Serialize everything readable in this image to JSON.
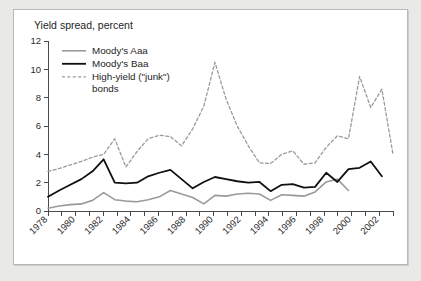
{
  "figure": {
    "title": "Yield spread, percent",
    "panel_bg": "#ffffff",
    "outer_bg": "#e9e9e7",
    "frame_color": "#b9b9b7"
  },
  "legend": {
    "position": "top-left-inside",
    "items": [
      {
        "label": "Moody's Aaa",
        "color": "#9a9a9a",
        "dash": "none",
        "width": 1.6
      },
      {
        "label": "Moody's Baa",
        "color": "#101010",
        "dash": "none",
        "width": 1.8
      },
      {
        "label": "High-yield (\"junk\")",
        "label2": "bonds",
        "color": "#9a9a9a",
        "dash": "3,2.4",
        "width": 1.3
      }
    ]
  },
  "chart_data": {
    "type": "line",
    "title": "Yield spread, percent",
    "xlabel": "",
    "ylabel": "Yield spread, percent",
    "ylim": [
      0,
      12
    ],
    "yticks": [
      0,
      2,
      4,
      6,
      8,
      10,
      12
    ],
    "xlim": [
      1978,
      2003
    ],
    "xticks": [
      1978,
      1980,
      1982,
      1984,
      1986,
      1988,
      1990,
      1992,
      1994,
      1996,
      1998,
      2000,
      2002
    ],
    "xticks_minor": [
      1978,
      1979,
      1980,
      1981,
      1982,
      1983,
      1984,
      1985,
      1986,
      1987,
      1988,
      1989,
      1990,
      1991,
      1992,
      1993,
      1994,
      1995,
      1996,
      1997,
      1998,
      1999,
      2000,
      2001,
      2002,
      2003
    ],
    "grid": false,
    "x": [
      1978,
      1979,
      1980,
      1981,
      1982,
      1983,
      1984,
      1985,
      1986,
      1987,
      1988,
      1989,
      1990,
      1991,
      1992,
      1993,
      1994,
      1995,
      1996,
      1997,
      1998,
      1999,
      2000,
      2001,
      2002,
      2003
    ],
    "series": [
      {
        "name": "Moody's Aaa",
        "color": "#9a9a9a",
        "dash": "none",
        "values": [
          0.2,
          0.35,
          0.45,
          0.5,
          0.75,
          1.3,
          0.8,
          0.7,
          0.65,
          0.8,
          1.0,
          1.45,
          1.2,
          0.95,
          0.5,
          1.1,
          1.05,
          1.2,
          1.25,
          1.2,
          0.75,
          1.15,
          1.1,
          1.05,
          1.35,
          2.05
        ]
      },
      {
        "name": "Moody's Baa",
        "color": "#101010",
        "dash": "none",
        "values": [
          1.0,
          1.45,
          1.85,
          2.25,
          2.8,
          3.65,
          2.0,
          1.95,
          2.0,
          2.45,
          2.7,
          2.9,
          2.25,
          1.6,
          2.05,
          2.4,
          2.25,
          2.1,
          2.0,
          2.05,
          1.4,
          1.85,
          1.9,
          1.65,
          1.7,
          2.7
        ]
      },
      {
        "name": "High-yield (\"junk\") bonds",
        "color": "#9a9a9a",
        "dash": "3,2.4",
        "values": [
          2.8,
          3.0,
          3.25,
          3.5,
          3.8,
          4.0,
          5.1,
          3.1,
          4.2,
          5.1,
          5.35,
          5.25,
          4.6,
          5.8,
          7.4,
          10.5,
          7.9,
          6.0,
          4.6,
          3.4,
          3.35,
          4.0,
          4.25,
          3.3,
          3.4,
          4.5
        ]
      }
    ],
    "series_extension": {
      "note": "values continue to 2003 end-point",
      "aaa_tail": [
        2.25,
        1.45
      ],
      "baa_tail": [
        2.95,
        3.05,
        3.5,
        2.45
      ],
      "junk_tail": [
        5.3,
        5.1,
        9.5,
        7.3,
        8.6,
        4.0
      ]
    }
  },
  "series_full": {
    "aaa": [
      0.2,
      0.35,
      0.45,
      0.5,
      0.75,
      1.3,
      0.8,
      0.7,
      0.65,
      0.8,
      1.0,
      1.45,
      1.2,
      0.95,
      0.5,
      1.1,
      1.05,
      1.2,
      1.25,
      1.2,
      0.75,
      1.15,
      1.1,
      1.05,
      1.35,
      2.05,
      2.25,
      1.45
    ],
    "baa": [
      1.0,
      1.45,
      1.85,
      2.25,
      2.8,
      3.65,
      2.0,
      1.95,
      2.0,
      2.45,
      2.7,
      2.9,
      2.25,
      1.6,
      2.05,
      2.4,
      2.25,
      2.1,
      2.0,
      2.05,
      1.4,
      1.85,
      1.9,
      1.65,
      1.7,
      2.7,
      2.05,
      2.95,
      3.05,
      3.5,
      2.45
    ],
    "junk": [
      2.8,
      3.0,
      3.25,
      3.5,
      3.8,
      4.0,
      5.1,
      3.1,
      4.2,
      5.1,
      5.35,
      5.25,
      4.6,
      5.8,
      7.4,
      10.5,
      7.9,
      6.0,
      4.6,
      3.4,
      3.35,
      4.0,
      4.25,
      3.3,
      3.4,
      4.5,
      5.3,
      5.1,
      9.5,
      7.3,
      8.6,
      4.0
    ]
  }
}
